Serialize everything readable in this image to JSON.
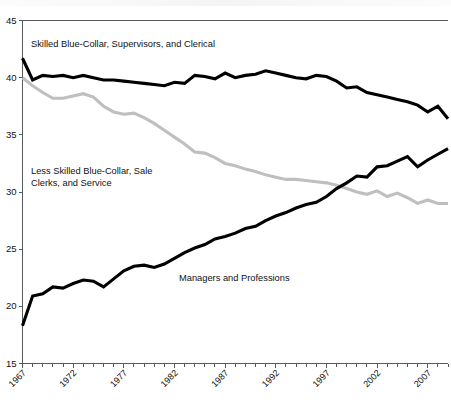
{
  "chart_data": {
    "type": "line",
    "title": "",
    "subtitle": "",
    "xlabel": "",
    "ylabel": "",
    "xlim": [
      1967,
      2009
    ],
    "ylim": [
      15,
      45
    ],
    "grid": false,
    "legend_position": "inline-annotations",
    "x_tick_labels": [
      "1967",
      "1972",
      "1977",
      "1982",
      "1987",
      "1992",
      "1997",
      "2002",
      "2007"
    ],
    "x_tick_values": [
      1967,
      1972,
      1977,
      1982,
      1987,
      1992,
      1997,
      2002,
      2007
    ],
    "y_tick_labels": [
      "15",
      "20",
      "25",
      "30",
      "35",
      "40",
      "45"
    ],
    "y_tick_values": [
      15,
      20,
      25,
      30,
      35,
      40,
      45
    ],
    "minor_x_ticks_every": 1,
    "x": [
      1967,
      1968,
      1969,
      1970,
      1971,
      1972,
      1973,
      1974,
      1975,
      1976,
      1977,
      1978,
      1979,
      1980,
      1981,
      1982,
      1983,
      1984,
      1985,
      1986,
      1987,
      1988,
      1989,
      1990,
      1991,
      1992,
      1993,
      1994,
      1995,
      1996,
      1997,
      1998,
      1999,
      2000,
      2001,
      2002,
      2003,
      2004,
      2005,
      2006,
      2007,
      2008,
      2009
    ],
    "series": [
      {
        "name": "Skilled Blue-Collar, Supervisors, and Clerical",
        "color": "#000000",
        "style": "solid-thick-black",
        "values": [
          41.7,
          39.8,
          40.2,
          40.1,
          40.2,
          40.0,
          40.2,
          40.0,
          39.8,
          39.8,
          39.7,
          39.6,
          39.5,
          39.4,
          39.3,
          39.6,
          39.5,
          40.2,
          40.1,
          39.9,
          40.4,
          40.0,
          40.2,
          40.3,
          40.6,
          40.4,
          40.2,
          40.0,
          39.9,
          40.2,
          40.1,
          39.7,
          39.1,
          39.2,
          38.7,
          38.5,
          38.3,
          38.1,
          37.9,
          37.6,
          37.0,
          37.5,
          36.4
        ],
        "label_position": {
          "x": 1969.5,
          "y": 42.3
        }
      },
      {
        "name": "Less Skilled Blue-Collar, Sale Clerks, and Service",
        "color": "#bfbfbf",
        "style": "solid-thick-gray",
        "values": [
          40.0,
          39.3,
          38.7,
          38.2,
          38.2,
          38.4,
          38.6,
          38.3,
          37.5,
          37.0,
          36.8,
          36.9,
          36.5,
          36.0,
          35.4,
          34.8,
          34.2,
          33.5,
          33.4,
          33.0,
          32.5,
          32.3,
          32.0,
          31.8,
          31.5,
          31.3,
          31.1,
          31.1,
          31.0,
          30.9,
          30.8,
          30.6,
          30.3,
          30.0,
          29.8,
          30.1,
          29.6,
          29.9,
          29.5,
          29.0,
          29.3,
          29.0,
          29.0
        ],
        "label_position": {
          "x": 1969.5,
          "y": 32.0
        }
      },
      {
        "name": "Managers and Professions",
        "color": "#000000",
        "style": "solid-thick-black",
        "values": [
          18.3,
          20.9,
          21.1,
          21.7,
          21.6,
          22.0,
          22.3,
          22.2,
          21.7,
          22.4,
          23.1,
          23.5,
          23.6,
          23.4,
          23.7,
          24.2,
          24.7,
          25.1,
          25.4,
          25.9,
          26.1,
          26.4,
          26.8,
          27.0,
          27.5,
          27.9,
          28.2,
          28.6,
          28.9,
          29.1,
          29.6,
          30.3,
          30.8,
          31.4,
          31.3,
          32.2,
          32.3,
          32.7,
          33.1,
          32.2,
          32.8,
          33.3,
          33.8
        ],
        "label_position": {
          "x": 1991.0,
          "y": 25.6
        }
      }
    ],
    "annotations": [
      {
        "id": "ann-skilled",
        "text": "Skilled Blue-Collar, Supervisors, and Clerical"
      },
      {
        "id": "ann-less-skilled-line1",
        "text": "Less Skilled Blue-Collar, Sale"
      },
      {
        "id": "ann-less-skilled-line2",
        "text": "Clerks, and Service"
      },
      {
        "id": "ann-managers",
        "text": "Managers and Professions"
      }
    ],
    "colors": {
      "dark_series": "#000000",
      "light_series": "#bfbfbf",
      "axis": "#555a5d",
      "background": "#ffffff",
      "text": "#111111"
    }
  }
}
